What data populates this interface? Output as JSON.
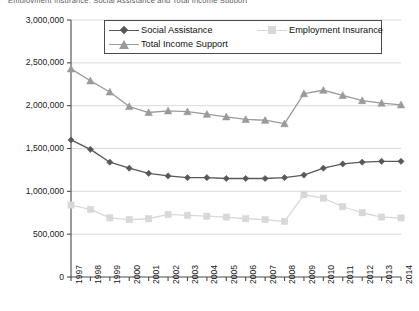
{
  "clipped_header": "Employment Insurance, Social Assistance and Total Income Support",
  "chart_data": {
    "type": "line",
    "title": "",
    "xlabel": "",
    "ylabel": "",
    "x": [
      1997,
      1998,
      1999,
      2000,
      2001,
      2002,
      2003,
      2004,
      2005,
      2006,
      2007,
      2008,
      2009,
      2010,
      2011,
      2012,
      2013,
      2014
    ],
    "categories": [
      "1997",
      "1998",
      "1999",
      "2000",
      "2001",
      "2002",
      "2003",
      "2004",
      "2005",
      "2006",
      "2007",
      "2008",
      "2009",
      "2010",
      "2011",
      "2012",
      "2013",
      "2014"
    ],
    "ylim": [
      0,
      3000000
    ],
    "yticks": [
      0,
      500000,
      1000000,
      1500000,
      2000000,
      2500000,
      3000000
    ],
    "ytick_labels": [
      "0",
      "500,000",
      "1,000,000",
      "1,500,000",
      "2,000,000",
      "2,500,000",
      "3,000,000"
    ],
    "grid": true,
    "legend_position": "top-center",
    "series": [
      {
        "name": "Social Assistance",
        "color": "#585858",
        "marker": "diamond",
        "values": [
          1600000,
          1490000,
          1340000,
          1270000,
          1210000,
          1180000,
          1160000,
          1160000,
          1150000,
          1150000,
          1150000,
          1160000,
          1190000,
          1270000,
          1320000,
          1340000,
          1350000,
          1350000
        ]
      },
      {
        "name": "Employment Insurance",
        "color": "#d8d8d8",
        "marker": "square",
        "values": [
          840000,
          790000,
          690000,
          670000,
          680000,
          730000,
          720000,
          710000,
          700000,
          680000,
          670000,
          650000,
          960000,
          920000,
          820000,
          750000,
          700000,
          690000
        ]
      },
      {
        "name": "Total Income Support",
        "color": "#9a9a9a",
        "marker": "triangle",
        "values": [
          2430000,
          2290000,
          2160000,
          1990000,
          1920000,
          1940000,
          1930000,
          1900000,
          1870000,
          1840000,
          1830000,
          1790000,
          2140000,
          2180000,
          2120000,
          2060000,
          2030000,
          2010000
        ]
      }
    ]
  },
  "axes": {
    "y_tick_labels": [
      "3,000,000",
      "2,500,000",
      "2,000,000",
      "1,500,000",
      "1,000,000",
      "500,000",
      "0"
    ],
    "x_tick_labels": [
      "1997",
      "1998",
      "1999",
      "2000",
      "2001",
      "2002",
      "2003",
      "2004",
      "2005",
      "2006",
      "2007",
      "2008",
      "2009",
      "2010",
      "2011",
      "2012",
      "2013",
      "2014"
    ]
  },
  "legend": {
    "items": [
      {
        "label": "Social Assistance",
        "color": "#585858",
        "marker": "diamond"
      },
      {
        "label": "Employment Insurance",
        "color": "#d8d8d8",
        "marker": "square"
      },
      {
        "label": "Total Income Support",
        "color": "#9a9a9a",
        "marker": "triangle"
      }
    ]
  },
  "colors": {
    "axis": "#4a4a4a",
    "grid": "#d0d0d0",
    "plot_background": "#ffffff"
  }
}
